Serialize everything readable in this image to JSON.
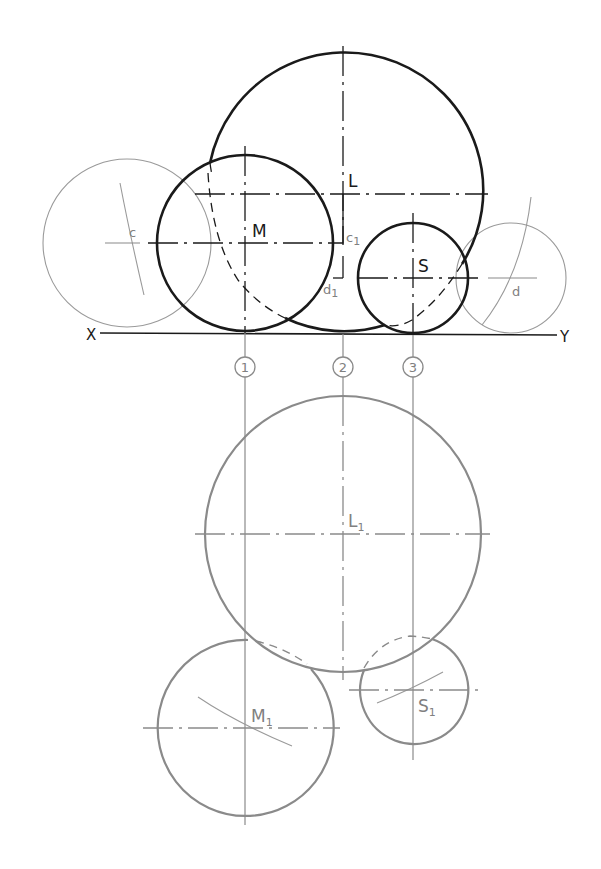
{
  "drawing": {
    "ground_line": {
      "left_label": "X",
      "right_label": "Y"
    },
    "elevation": {
      "large_sphere": {
        "label": "L"
      },
      "medium_sphere": {
        "label": "M"
      },
      "small_sphere": {
        "label": "S"
      },
      "construction_circle_c": {
        "label": "c"
      },
      "construction_circle_d": {
        "label": "d"
      },
      "point_c1": {
        "label": "c",
        "sub": "1"
      },
      "point_d1": {
        "label": "d",
        "sub": "1"
      }
    },
    "projection_markers": [
      {
        "number": "1"
      },
      {
        "number": "2"
      },
      {
        "number": "3"
      }
    ],
    "plan": {
      "large_sphere": {
        "label": "L",
        "sub": "1"
      },
      "medium_sphere": {
        "label": "M",
        "sub": "1"
      },
      "small_sphere": {
        "label": "S",
        "sub": "1"
      }
    },
    "colors": {
      "elevation_stroke": "#1a1a1a",
      "plan_stroke": "#8a8a8a",
      "construction_stroke": "#9a9a9a",
      "background": "#ffffff"
    }
  }
}
